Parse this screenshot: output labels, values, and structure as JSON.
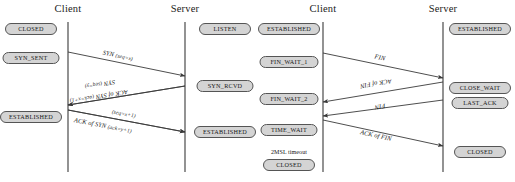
{
  "figure": {
    "kind": "tcp-sequence-diagrams",
    "line_color": "#3a3a3a",
    "box_fill": "#d4d4d4",
    "box_stroke": "#555555",
    "text_color": "#141414"
  },
  "diagrams": [
    {
      "id": "handshake",
      "name": "tcp-three-way-handshake",
      "columns": [
        {
          "id": "client",
          "title": "Client",
          "x": 68
        },
        {
          "id": "server",
          "title": "Server",
          "x": 185
        }
      ],
      "timeline": {
        "top": 22,
        "bottom": 172
      },
      "states": [
        {
          "id": "client-closed",
          "label": "CLOSED",
          "column": "client",
          "x": 31,
          "y": 29,
          "w": 52
        },
        {
          "id": "client-syn-sent",
          "label": "SYN_SENT",
          "column": "client",
          "x": 31,
          "y": 58,
          "w": 57
        },
        {
          "id": "client-established",
          "label": "ESTABLISHED",
          "column": "client",
          "x": 31,
          "y": 117,
          "w": 62
        },
        {
          "id": "server-listen",
          "label": "LISTEN",
          "column": "server",
          "x": 225,
          "y": 29,
          "w": 52
        },
        {
          "id": "server-syn-rcvd",
          "label": "SYN_RCVD",
          "column": "server",
          "x": 225,
          "y": 86,
          "w": 57
        },
        {
          "id": "server-established",
          "label": "ESTABLISHED",
          "column": "server",
          "x": 225,
          "y": 132,
          "w": 62
        }
      ],
      "messages": [
        {
          "id": "syn-x",
          "text": "SYN ",
          "params": "(seq=x)",
          "from": {
            "x": 68,
            "y": 52
          },
          "to": {
            "x": 185,
            "y": 76
          },
          "label_x": 118,
          "label_y": 55
        },
        {
          "id": "syn-y",
          "text": "SYN ",
          "params": "(seq=y)",
          "from": {
            "x": 185,
            "y": 86
          },
          "to": {
            "x": 68,
            "y": 105
          },
          "label_x": 100,
          "label_y": 85
        },
        {
          "id": "ack-of-syn-x",
          "text": "ACK of SYN ",
          "params": "(ack=x+1)",
          "from": {
            "x": 185,
            "y": 86
          },
          "to": {
            "x": 68,
            "y": 105
          },
          "label_x": 99,
          "label_y": 97
        },
        {
          "id": "seq-x1",
          "text": "",
          "params": "(seq=x+1)",
          "from": {
            "x": 68,
            "y": 110
          },
          "to": {
            "x": 185,
            "y": 132
          },
          "label_x": 124,
          "label_y": 113
        },
        {
          "id": "ack-of-syn-y",
          "text": "ACK of SYN ",
          "params": "(ack=y+1)",
          "from": {
            "x": 68,
            "y": 110
          },
          "to": {
            "x": 185,
            "y": 132
          },
          "label_x": 103,
          "label_y": 125
        }
      ],
      "notes": []
    },
    {
      "id": "teardown",
      "name": "tcp-connection-teardown",
      "columns": [
        {
          "id": "client",
          "title": "Client",
          "x": 65
        },
        {
          "id": "server",
          "title": "Server",
          "x": 185
        }
      ],
      "timeline": {
        "top": 22,
        "bottom": 172
      },
      "states": [
        {
          "id": "client-established",
          "label": "ESTABLISHED",
          "column": "client",
          "x": 31,
          "y": 29,
          "w": 62
        },
        {
          "id": "client-fin-wait-1",
          "label": "FIN_WAIT_1",
          "column": "client",
          "x": 31,
          "y": 62,
          "w": 59
        },
        {
          "id": "client-fin-wait-2",
          "label": "FIN_WAIT_2",
          "column": "client",
          "x": 31,
          "y": 99,
          "w": 59
        },
        {
          "id": "client-time-wait",
          "label": "TIME_WAIT",
          "column": "client",
          "x": 31,
          "y": 130,
          "w": 57
        },
        {
          "id": "client-closed",
          "label": "CLOSED",
          "column": "client",
          "x": 31,
          "y": 165,
          "w": 52
        },
        {
          "id": "server-established",
          "label": "ESTABLISHED",
          "column": "server",
          "x": 222,
          "y": 29,
          "w": 62
        },
        {
          "id": "server-close-wait",
          "label": "CLOSE_WAIT",
          "column": "server",
          "x": 222,
          "y": 88,
          "w": 62
        },
        {
          "id": "server-last-ack",
          "label": "LAST_ACK",
          "column": "server",
          "x": 222,
          "y": 103,
          "w": 57
        },
        {
          "id": "server-closed",
          "label": "CLOSED",
          "column": "server",
          "x": 222,
          "y": 152,
          "w": 52
        }
      ],
      "messages": [
        {
          "id": "fin-1",
          "text": "FIN",
          "params": "",
          "from": {
            "x": 65,
            "y": 53
          },
          "to": {
            "x": 185,
            "y": 78
          },
          "label_x": 122,
          "label_y": 57
        },
        {
          "id": "ack-of-fin-1",
          "text": "ACK of FIN",
          "params": "",
          "from": {
            "x": 185,
            "y": 82
          },
          "to": {
            "x": 65,
            "y": 102
          },
          "label_x": 118,
          "label_y": 84
        },
        {
          "id": "fin-2",
          "text": "FIN",
          "params": "",
          "from": {
            "x": 185,
            "y": 100
          },
          "to": {
            "x": 65,
            "y": 116
          },
          "label_x": 122,
          "label_y": 107
        },
        {
          "id": "ack-of-fin-2",
          "text": "ACK of FIN",
          "params": "",
          "from": {
            "x": 65,
            "y": 120
          },
          "to": {
            "x": 185,
            "y": 146
          },
          "label_x": 118,
          "label_y": 135
        }
      ],
      "notes": [
        {
          "id": "msl-timeout",
          "label": "2MSL timeout",
          "x": 31,
          "y": 149
        }
      ]
    }
  ]
}
